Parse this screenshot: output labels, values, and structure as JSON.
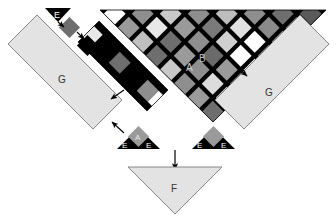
{
  "figure": {
    "background_color": "#ffffff",
    "width": 336,
    "height": 221
  },
  "palette": {
    "black": "#000000",
    "white": "#ffffff",
    "light_gray": "#d8d8d8",
    "panel_gray": "#e3e3e3",
    "mid_gray": "#9a9a9a",
    "dark_gray": "#6e6e6e",
    "very_light": "#f0f0f0",
    "outline": "#555555",
    "arrow": "#000000"
  },
  "labels": {
    "a_main": "A",
    "b_main": "B",
    "a_small": "A",
    "e_top": "E",
    "e_left_1": "E",
    "e_left_2": "E",
    "e_right_1": "E",
    "e_right_2": "E",
    "f_bottom": "F",
    "g_left": "G",
    "g_right": "G"
  },
  "components": [
    {
      "id": "A",
      "label": "A",
      "role": "light diamond tile in checkerboard"
    },
    {
      "id": "B",
      "label": "B",
      "role": "black diamond tile in checkerboard"
    },
    {
      "id": "E",
      "label": "E",
      "role": "small black triangle element"
    },
    {
      "id": "F",
      "label": "F",
      "role": "large inverted light triangle"
    },
    {
      "id": "G",
      "label": "G",
      "role": "long light rectangular bar"
    }
  ],
  "checkerboard": {
    "description": "Large inverted triangular checkerboard of diamond tiles",
    "tile_shades": [
      "#000000",
      "#ffffff",
      "#d8d8d8",
      "#9a9a9a",
      "#6e6e6e"
    ],
    "rows": [
      [
        "#000000",
        "#ffffff",
        "#000000",
        "#8e8e8e",
        "#000000",
        "#c9c9c9",
        "#000000",
        "#8e8e8e",
        "#000000",
        "#bdbdbd",
        "#000000",
        "#8e8e8e",
        "#000000",
        "#6e6e6e",
        "#000000"
      ],
      [
        "#000000",
        "#9a9a9a",
        "#000000",
        "#e8e8e8",
        "#000000",
        "#9a9a9a",
        "#000000",
        "#7a7a7a",
        "#000000",
        "#e0e0e0",
        "#000000",
        "#8a8a8a",
        "#000000"
      ],
      [
        "#000000",
        "#c0c0c0",
        "#000000",
        "#6e6e6e",
        "#000000",
        "#8e8e8e",
        "#000000",
        "#d0d0d0",
        "#000000",
        "#ffffff",
        "#000000"
      ],
      [
        "#000000",
        "#8a8a8a",
        "#000000",
        "#dcdcdc",
        "#000000",
        "#9a9a9a",
        "#000000",
        "#ffffff",
        "#000000"
      ],
      [
        "#000000",
        "#7a7a7a",
        "#000000",
        "#c8c8c8",
        "#000000",
        "#8e8e8e",
        "#000000"
      ],
      [
        "#000000",
        "#a8a8a8",
        "#000000",
        "#8e8e8e",
        "#000000"
      ],
      [
        "#000000",
        "#bdbdbd",
        "#000000"
      ],
      [
        "#000000"
      ]
    ]
  },
  "strip": {
    "description": "Diagonal checkered strip detached along the left edge",
    "tiles": [
      "#000000",
      "#e8e8e8",
      "#000000",
      "#6e6e6e",
      "#000000",
      "#8e8e8e",
      "#000000",
      "#ffffff"
    ]
  },
  "chain": {
    "description": "Top-left sequence: E triangle then gray diamond then black diamond",
    "steps": [
      "E",
      "gray-diamond",
      "black-diamond"
    ]
  },
  "arrows": [
    {
      "name": "e-to-gray-diamond",
      "from": "E",
      "to": "gray diamond"
    },
    {
      "name": "gray-to-black-diamond",
      "from": "gray diamond",
      "to": "black diamond"
    },
    {
      "name": "checker-to-left-strip",
      "from": "checkerboard",
      "to": "left strip"
    },
    {
      "name": "strip-to-left-g",
      "from": "left strip",
      "to": "left G bar"
    },
    {
      "name": "left-triangle-to-left-g",
      "from": "left E triangle",
      "to": "left G bar"
    },
    {
      "name": "checker-to-right-g",
      "from": "checkerboard",
      "to": "right G bar"
    },
    {
      "name": "assembly-to-f",
      "from": "assembly",
      "to": "F triangle"
    }
  ]
}
